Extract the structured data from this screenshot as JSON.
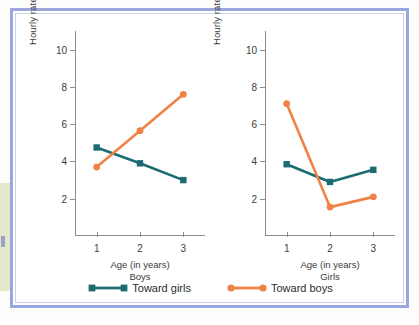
{
  "chart_data": [
    {
      "type": "line",
      "title": "Boys",
      "xlabel": "Age (in years)",
      "ylabel": "Hourly rate of aggressive behaviors",
      "categories": [
        "1",
        "2",
        "3"
      ],
      "x": [
        1,
        2,
        3
      ],
      "xlim": [
        0.5,
        3.5
      ],
      "ylim": [
        0,
        11
      ],
      "yticks": [
        2,
        4,
        6,
        8,
        10
      ],
      "grid": false,
      "series": [
        {
          "name": "Toward girls",
          "values": [
            4.75,
            3.9,
            3.0
          ],
          "color": "#1b6b72",
          "marker": "square"
        },
        {
          "name": "Toward boys",
          "values": [
            3.7,
            5.65,
            7.6
          ],
          "color": "#ef8244",
          "marker": "circle"
        }
      ]
    },
    {
      "type": "line",
      "title": "Girls",
      "xlabel": "Age (in years)",
      "ylabel": "Hourly rate of aggressive behaviors",
      "categories": [
        "1",
        "2",
        "3"
      ],
      "x": [
        1,
        2,
        3
      ],
      "xlim": [
        0.5,
        3.5
      ],
      "ylim": [
        0,
        11
      ],
      "yticks": [
        2,
        4,
        6,
        8,
        10
      ],
      "grid": false,
      "series": [
        {
          "name": "Toward girls",
          "values": [
            3.85,
            2.9,
            3.55
          ],
          "color": "#1b6b72",
          "marker": "square"
        },
        {
          "name": "Toward boys",
          "values": [
            7.1,
            1.55,
            2.1
          ],
          "color": "#ef8244",
          "marker": "circle"
        }
      ]
    }
  ],
  "legend": {
    "position": "bottom",
    "items": [
      {
        "label": "Toward girls",
        "color": "#1b6b72",
        "marker": "square"
      },
      {
        "label": "Toward boys",
        "color": "#ef8244",
        "marker": "circle"
      }
    ]
  },
  "colors": {
    "frame_border": "#9aa6dd",
    "axis": "#8d8d8d",
    "text": "#3b3b3b",
    "teal": "#1b6b72",
    "orange": "#ef8244",
    "side_band": "#e3e8c8"
  }
}
